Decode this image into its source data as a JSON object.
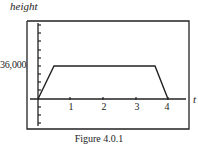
{
  "figure": {
    "caption": "Figure 4.0.1",
    "y_axis_label": "height",
    "x_axis_label": "t",
    "y_tick_label": "36,000",
    "x_tick_labels": [
      "1",
      "2",
      "3",
      "4"
    ]
  },
  "colors": {
    "line": "#222222",
    "background": "#ffffff"
  }
}
